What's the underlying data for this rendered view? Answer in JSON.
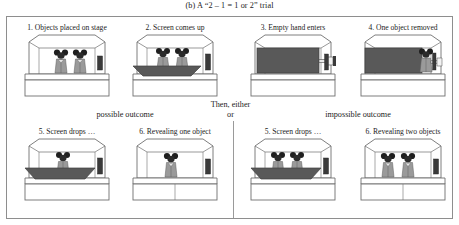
{
  "figure": {
    "caption": "(b) A “2 – 1 = 1 or 2” trial"
  },
  "sequence": {
    "top_panels": [
      {
        "id": "panel-1",
        "label": "1. Objects placed on stage",
        "objects": 2,
        "screen": "down",
        "hand": "none"
      },
      {
        "id": "panel-2",
        "label": "2. Screen comes up",
        "objects": 2,
        "screen": "rising",
        "hand": "none"
      },
      {
        "id": "panel-3",
        "label": "3. Empty hand enters",
        "objects": 0,
        "screen": "up",
        "hand": "empty"
      },
      {
        "id": "panel-4",
        "label": "4. One object removed",
        "objects": 0,
        "screen": "up",
        "hand": "holding"
      }
    ],
    "branch": {
      "then_line": "Then, either",
      "or_line": "or",
      "left_heading": "possible outcome",
      "right_heading": "impossible outcome"
    },
    "bottom_left_panels": [
      {
        "id": "panel-5-left",
        "label": "5. Screen drops …",
        "objects": 1,
        "screen": "falling"
      },
      {
        "id": "panel-6-left",
        "label": "6. Revealing one object",
        "objects": 1,
        "screen": "down"
      }
    ],
    "bottom_right_panels": [
      {
        "id": "panel-5-right",
        "label": "5. Screen drops …",
        "objects": 2,
        "screen": "falling"
      },
      {
        "id": "panel-6-right",
        "label": "6. Revealing two objects",
        "objects": 2,
        "screen": "down"
      }
    ]
  },
  "colors": {
    "frame_border": "#8e8e8e",
    "stage_line": "#6f6f6f",
    "screen_fill": "#595959",
    "figure_body": "#8f8f8f",
    "figure_head": "#2b2b2b",
    "text": "#1c1c1c",
    "background": "#ffffff"
  }
}
